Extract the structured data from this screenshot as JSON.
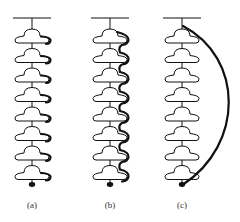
{
  "figure": {
    "disc_count": 8,
    "panels": [
      {
        "id": "a",
        "label": "(a)",
        "path_type": "brim-shadow"
      },
      {
        "id": "b",
        "label": "(b)",
        "path_type": "serpentine"
      },
      {
        "id": "c",
        "label": "(c)",
        "path_type": "bypass-arc"
      }
    ]
  },
  "colors": {
    "line": "#111111",
    "disc_fill": "#ffffff",
    "label": "#333333"
  }
}
